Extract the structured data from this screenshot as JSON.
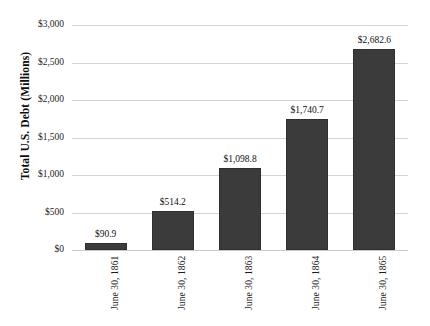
{
  "chart_data": {
    "type": "bar",
    "title": "",
    "xlabel": "",
    "ylabel": "Total U.S. Debt (Millions)",
    "ylim": [
      0,
      3000
    ],
    "grid": true,
    "legend": "none",
    "categories": [
      "June 30, 1861",
      "June 30, 1862",
      "June 30, 1863",
      "June 30, 1864",
      "June 30, 1865"
    ],
    "values": [
      90.9,
      514.2,
      1098.8,
      1740.7,
      2682.6
    ],
    "value_labels": [
      "$90.9",
      "$514.2",
      "$1,098.8",
      "$1,740.7",
      "$2,682.6"
    ],
    "y_ticks": [
      3000,
      2500,
      2000,
      1500,
      1000,
      500,
      0
    ],
    "y_tick_labels": [
      "$3,000",
      "$2,500",
      "$2,000",
      "$1,500",
      "$1,000",
      "$500",
      "$0"
    ],
    "bar_color": "#3b3b3b",
    "gridline_color": "#d4d4d4",
    "background_color": "#ffffff"
  }
}
